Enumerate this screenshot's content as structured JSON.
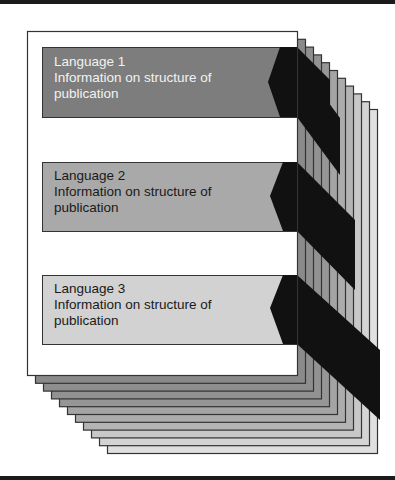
{
  "diagram": {
    "stacked_page_count": 10,
    "colors": {
      "frame_bar": "#1a1a1a",
      "page_border": "#333333",
      "front_page": "#ffffff",
      "tab_black": "#111111",
      "stack_fills": [
        "#8a8a8a",
        "#8e8e8e",
        "#929292",
        "#969696",
        "#a4a4a4",
        "#acacac",
        "#b4b4b4",
        "#c8c8c8",
        "#d4d4d4",
        "#e0e0e0"
      ]
    },
    "sections": [
      {
        "language": "Language 1",
        "line2": "Information on structure of",
        "line3": "publication",
        "fill": "#7d7d7d",
        "text_color": "#f2f2f2"
      },
      {
        "language": "Language 2",
        "line2": "Information on structure of",
        "line3": "publication",
        "fill": "#a9a9a9",
        "text_color": "#1a1a1a"
      },
      {
        "language": "Language 3",
        "line2": "Information on structure of",
        "line3": "publication",
        "fill": "#d2d2d2",
        "text_color": "#1a1a1a"
      }
    ]
  }
}
